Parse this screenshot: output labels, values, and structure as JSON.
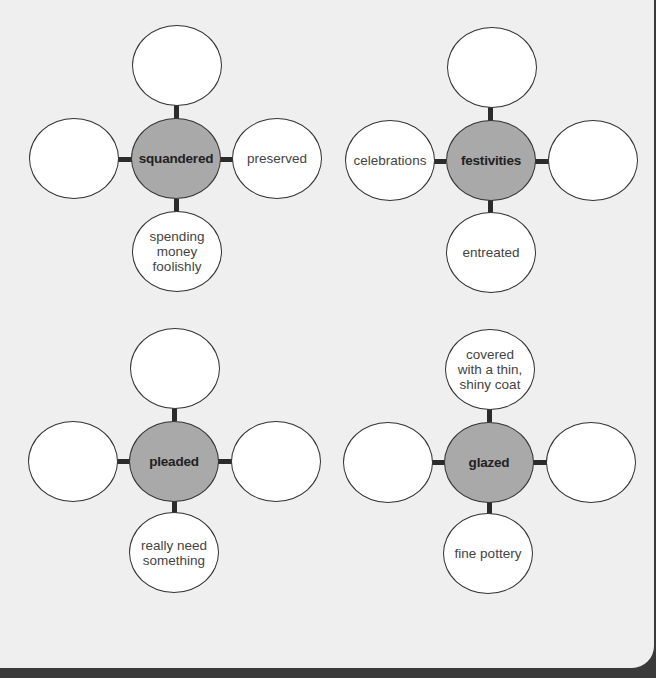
{
  "colors": {
    "background": "#efefef",
    "center_fill": "#a9a9a9",
    "node_fill": "#ffffff",
    "outline": "#333333",
    "connector": "#2b2b2b"
  },
  "webs": [
    {
      "center": "squandered",
      "top": "",
      "left": "",
      "right": "preserved",
      "bottom": "spending\nmoney\nfoolishly"
    },
    {
      "center": "festivities",
      "top": "",
      "left": "celebrations",
      "right": "",
      "bottom": "entreated"
    },
    {
      "center": "pleaded",
      "top": "",
      "left": "",
      "right": "",
      "bottom": "really need\nsomething"
    },
    {
      "center": "glazed",
      "top": "covered\nwith a thin,\nshiny coat",
      "left": "",
      "right": "",
      "bottom": "fine pottery"
    }
  ]
}
